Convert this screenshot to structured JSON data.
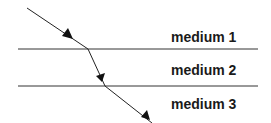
{
  "diagram": {
    "type": "refraction-through-layers",
    "media": [
      {
        "label": "medium 1",
        "x": 171,
        "y": 30
      },
      {
        "label": "medium 2",
        "x": 171,
        "y": 63
      },
      {
        "label": "medium 3",
        "x": 171,
        "y": 97
      }
    ],
    "boundaries": [
      {
        "x1": 18,
        "y1": 49,
        "x2": 258,
        "y2": 49
      },
      {
        "x1": 18,
        "y1": 86,
        "x2": 258,
        "y2": 86
      }
    ],
    "ray_points": [
      [
        27,
        8
      ],
      [
        88,
        49
      ],
      [
        105,
        86
      ],
      [
        152,
        123
      ]
    ],
    "colors": {
      "line": "#333333",
      "ray": "#222222",
      "arrow": "#111111",
      "text": "#1a1a1a"
    }
  }
}
